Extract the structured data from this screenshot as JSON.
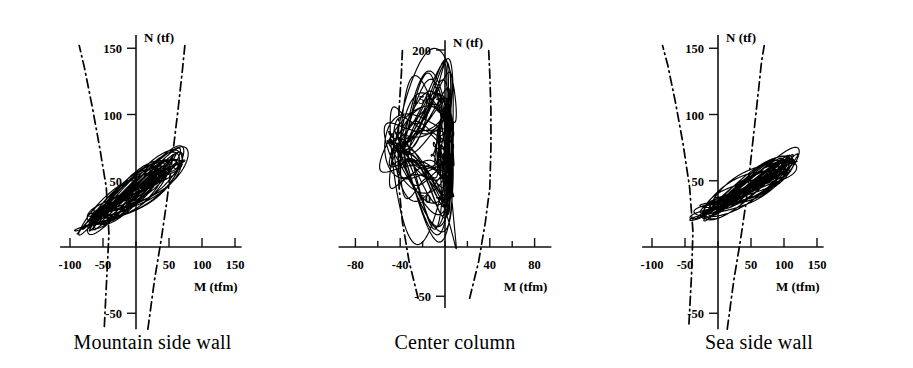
{
  "figure": {
    "type": "multi-panel-hysteresis",
    "panel_count": 3
  },
  "panels": [
    {
      "caption": "Mountain side wall",
      "xlabel": "M (tfm)",
      "ylabel": "N (tf)",
      "x_ticks": [
        -100,
        -50,
        0,
        50,
        100,
        150
      ],
      "x_tick_labels": [
        "-100",
        "-50",
        "",
        "50",
        "100",
        "150"
      ],
      "y_ticks": [
        -50,
        0,
        50,
        100,
        150
      ],
      "y_tick_labels": [
        "-50",
        "",
        "50",
        "100",
        "150"
      ],
      "xlim": [
        -115,
        160
      ],
      "ylim": [
        -62,
        160
      ]
    },
    {
      "caption": "Center column",
      "xlabel": "M (tfm)",
      "ylabel": "N (tf)",
      "x_ticks": [
        -80,
        -60,
        -40,
        -20,
        0,
        20,
        40,
        60,
        80
      ],
      "x_tick_labels": [
        "-80",
        "",
        "-40",
        "",
        "",
        "",
        "40",
        "",
        "80"
      ],
      "y_ticks": [
        -50,
        0,
        50,
        100,
        150,
        200
      ],
      "y_tick_labels": [
        "-50",
        "",
        "50",
        "",
        "150",
        "200"
      ],
      "xlim": [
        -95,
        95
      ],
      "ylim": [
        -62,
        210
      ]
    },
    {
      "caption": "Sea side wall",
      "xlabel": "M (tfm)",
      "ylabel": "N (tf)",
      "x_ticks": [
        -100,
        -50,
        0,
        50,
        100,
        150
      ],
      "x_tick_labels": [
        "-100",
        "-50",
        "",
        "50",
        "100",
        "150"
      ],
      "y_ticks": [
        -50,
        0,
        50,
        100,
        150
      ],
      "y_tick_labels": [
        "-50",
        "",
        "50",
        "100",
        "150"
      ],
      "xlim": [
        -115,
        160
      ],
      "ylim": [
        -62,
        160
      ]
    }
  ],
  "chart_data": [
    {
      "type": "line",
      "title": "Mountain side wall",
      "xlabel": "M (tfm)",
      "ylabel": "N (tf)",
      "xlim": [
        -115,
        160
      ],
      "ylim": [
        -62,
        160
      ],
      "grid": false,
      "legend": "none",
      "series": [
        {
          "name": "N-M interaction envelope (left branch)",
          "style": "dash-dot",
          "points": [
            [
              -48,
              -60
            ],
            [
              -44,
              -20
            ],
            [
              -41,
              10
            ],
            [
              -45,
              45
            ],
            [
              -55,
              75
            ],
            [
              -66,
              105
            ],
            [
              -78,
              135
            ],
            [
              -86,
              152
            ]
          ]
        },
        {
          "name": "N-M interaction envelope (right branch)",
          "style": "dash-dot",
          "points": [
            [
              18,
              -62
            ],
            [
              28,
              -25
            ],
            [
              38,
              5
            ],
            [
              46,
              32
            ],
            [
              52,
              55
            ],
            [
              58,
              80
            ],
            [
              64,
              105
            ],
            [
              70,
              132
            ],
            [
              74,
              152
            ]
          ]
        },
        {
          "name": "Hysteresis response (M-N orbit)",
          "style": "solid",
          "description": "Dense elongated loops rising diagonally from lower-left to upper-right",
          "extent_M": [
            -90,
            75
          ],
          "extent_N": [
            8,
            68
          ],
          "loop_count": 28,
          "axial_load_mean": 40,
          "slope_N_per_M": 0.34
        }
      ]
    },
    {
      "type": "line",
      "title": "Center column",
      "xlabel": "M (tfm)",
      "ylabel": "N (tf)",
      "xlim": [
        -95,
        95
      ],
      "ylim": [
        -62,
        210
      ],
      "grid": false,
      "legend": "none",
      "series": [
        {
          "name": "N-M interaction envelope (left branch)",
          "style": "dash-dot",
          "points": [
            [
              -24,
              -52
            ],
            [
              -32,
              -15
            ],
            [
              -38,
              25
            ],
            [
              -41,
              60
            ],
            [
              -42,
              100
            ],
            [
              -41,
              140
            ],
            [
              -39,
              175
            ],
            [
              -38,
              200
            ]
          ]
        },
        {
          "name": "N-M interaction envelope (right branch)",
          "style": "dash-dot",
          "points": [
            [
              22,
              -52
            ],
            [
              30,
              -15
            ],
            [
              36,
              25
            ],
            [
              40,
              60
            ],
            [
              41,
              100
            ],
            [
              41,
              140
            ],
            [
              40,
              175
            ],
            [
              39,
              200
            ]
          ]
        },
        {
          "name": "Hysteresis response (M-N orbit)",
          "style": "solid",
          "description": "Tall narrow oscillations clustered near zero moment, nearly constant axial load",
          "extent_M": [
            -62,
            36
          ],
          "extent_N": [
            42,
            155
          ],
          "loop_count": 30,
          "axial_load_mean": 100,
          "slope_N_per_M": 0.0
        }
      ]
    },
    {
      "type": "line",
      "title": "Sea side wall",
      "xlabel": "M (tfm)",
      "ylabel": "N (tf)",
      "xlim": [
        -115,
        160
      ],
      "ylim": [
        -62,
        160
      ],
      "grid": false,
      "legend": "none",
      "series": [
        {
          "name": "N-M interaction envelope (left branch)",
          "style": "dash-dot",
          "points": [
            [
              -44,
              -58
            ],
            [
              -40,
              -20
            ],
            [
              -38,
              12
            ],
            [
              -43,
              45
            ],
            [
              -53,
              78
            ],
            [
              -64,
              108
            ],
            [
              -76,
              137
            ],
            [
              -84,
              152
            ]
          ]
        },
        {
          "name": "N-M interaction envelope (right branch)",
          "style": "dash-dot",
          "points": [
            [
              14,
              -62
            ],
            [
              24,
              -25
            ],
            [
              34,
              5
            ],
            [
              42,
              32
            ],
            [
              48,
              58
            ],
            [
              54,
              85
            ],
            [
              60,
              112
            ],
            [
              66,
              140
            ],
            [
              70,
              152
            ]
          ]
        },
        {
          "name": "Hysteresis response (M-N orbit)",
          "style": "solid",
          "description": "Dense loops rising from lower-left to upper-right with a long thin tail to the right",
          "extent_M": [
            -35,
            126
          ],
          "extent_N": [
            20,
            72
          ],
          "loop_count": 28,
          "axial_load_mean": 45,
          "slope_N_per_M": 0.28
        }
      ]
    }
  ]
}
